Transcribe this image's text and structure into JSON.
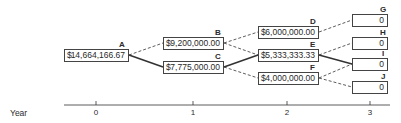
{
  "diagram": {
    "type": "binomial-tree",
    "nodes": [
      {
        "id": "A",
        "label": "A",
        "currency": "$",
        "value": "14,664,166.67",
        "year": 0
      },
      {
        "id": "B",
        "label": "B",
        "currency": "$",
        "value": "9,200,000.00",
        "year": 1
      },
      {
        "id": "C",
        "label": "C",
        "currency": "$",
        "value": "7,775,000.00",
        "year": 1
      },
      {
        "id": "D",
        "label": "D",
        "currency": "$",
        "value": "6,000,000.00",
        "year": 2
      },
      {
        "id": "E",
        "label": "E",
        "currency": "$",
        "value": "5,333,333.33",
        "year": 2
      },
      {
        "id": "F",
        "label": "F",
        "currency": "$",
        "value": "4,000,000.00",
        "year": 2
      },
      {
        "id": "G",
        "label": "G",
        "currency": "",
        "value": "0",
        "year": 3
      },
      {
        "id": "H",
        "label": "H",
        "currency": "",
        "value": "0",
        "year": 3
      },
      {
        "id": "I",
        "label": "I",
        "currency": "",
        "value": "0",
        "year": 3
      },
      {
        "id": "J",
        "label": "J",
        "currency": "",
        "value": "0",
        "year": 3
      }
    ],
    "edges": [
      {
        "from": "A",
        "to": "B",
        "style": "dashed"
      },
      {
        "from": "A",
        "to": "C",
        "style": "solid"
      },
      {
        "from": "B",
        "to": "D",
        "style": "dashed"
      },
      {
        "from": "B",
        "to": "E",
        "style": "dashed"
      },
      {
        "from": "C",
        "to": "E",
        "style": "solid"
      },
      {
        "from": "C",
        "to": "F",
        "style": "dashed"
      },
      {
        "from": "D",
        "to": "G",
        "style": "dashed"
      },
      {
        "from": "E",
        "to": "H",
        "style": "dashed"
      },
      {
        "from": "E",
        "to": "I",
        "style": "solid"
      },
      {
        "from": "F",
        "to": "I",
        "style": "dashed"
      },
      {
        "from": "F",
        "to": "J",
        "style": "dashed"
      }
    ],
    "axis": {
      "label": "Year",
      "ticks": [
        "0",
        "1",
        "2",
        "3"
      ]
    }
  }
}
